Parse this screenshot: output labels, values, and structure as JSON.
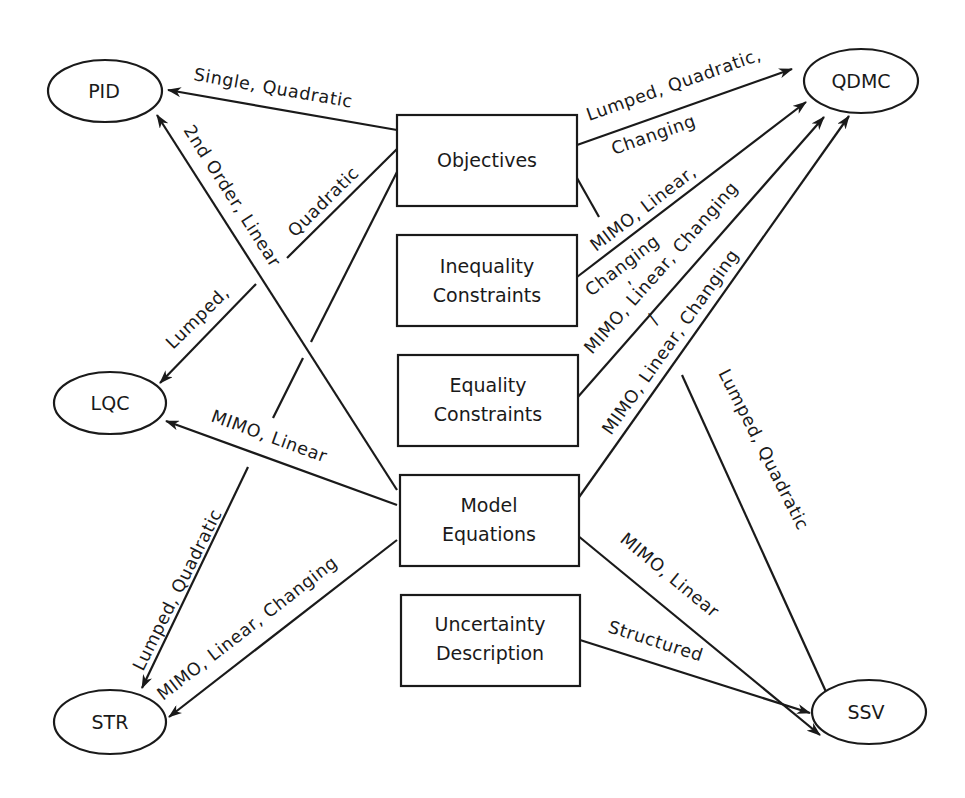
{
  "diagram": {
    "type": "controller-feature-map",
    "center_boxes": [
      {
        "id": "objectives",
        "lines": [
          "Objectives"
        ]
      },
      {
        "id": "inequality",
        "lines": [
          "Inequality",
          "Constraints"
        ]
      },
      {
        "id": "equality",
        "lines": [
          "Equality",
          "Constraints"
        ]
      },
      {
        "id": "model",
        "lines": [
          "Model",
          "Equations"
        ]
      },
      {
        "id": "uncertainty",
        "lines": [
          "Uncertainty",
          "Description"
        ]
      }
    ],
    "controllers": [
      {
        "id": "pid",
        "label": "PID"
      },
      {
        "id": "qdmc",
        "label": "QDMC"
      },
      {
        "id": "lqc",
        "label": "LQC"
      },
      {
        "id": "str",
        "label": "STR"
      },
      {
        "id": "ssv",
        "label": "SSV"
      }
    ],
    "edges": [
      {
        "from": "objectives",
        "to": "pid",
        "label": "Single, Quadratic"
      },
      {
        "from": "objectives",
        "to": "lqc",
        "label_parts": [
          "Quadratic",
          "Lumped,"
        ]
      },
      {
        "from": "objectives",
        "to": "str",
        "label": "Lumped, Quadratic"
      },
      {
        "from": "model",
        "to": "pid",
        "label": "2nd Order, Linear"
      },
      {
        "from": "model",
        "to": "lqc",
        "label": "MIMO, Linear"
      },
      {
        "from": "model",
        "to": "str",
        "label": "MIMO, Linear, Changing"
      },
      {
        "from": "objectives",
        "to": "qdmc",
        "label_parts": [
          "Lumped, Quadratic,",
          "Changing"
        ]
      },
      {
        "from": "objectives",
        "to": "ssv",
        "label": "Lumped, Quadratic"
      },
      {
        "from": "inequality",
        "to": "qdmc",
        "label_parts": [
          "MIMO, Linear,",
          "Changing"
        ]
      },
      {
        "from": "equality",
        "to": "qdmc",
        "label_parts": [
          ",",
          "MIMO, Linear, Changing"
        ]
      },
      {
        "from": "model",
        "to": "qdmc",
        "label_parts": [
          "/",
          "MIMO, Linear, Changing"
        ]
      },
      {
        "from": "model",
        "to": "ssv",
        "label": "MIMO, Linear"
      },
      {
        "from": "uncertainty",
        "to": "ssv",
        "label": "Structured"
      }
    ]
  }
}
